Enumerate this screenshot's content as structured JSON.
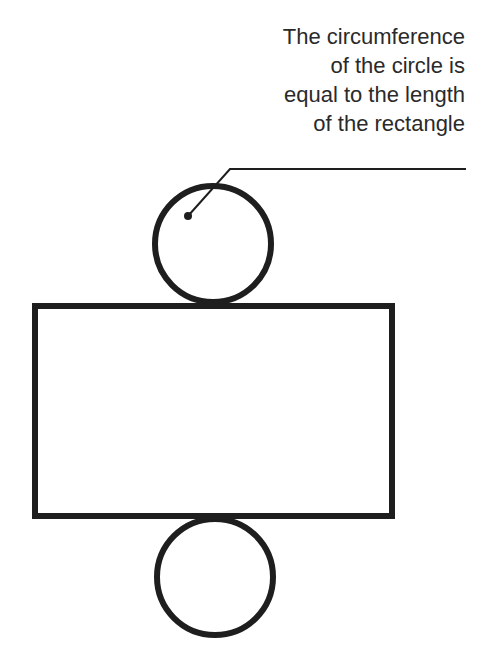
{
  "diagram": {
    "annotation_lines": [
      "The circumference",
      "of the circle is",
      "equal to the length",
      "of the rectangle"
    ],
    "stroke_color": "#1e1e1e",
    "shapes": {
      "top_circle": {
        "cx": 213,
        "cy": 244,
        "r": 58
      },
      "rectangle": {
        "x": 35,
        "y": 306,
        "width": 357,
        "height": 210
      },
      "bottom_circle": {
        "cx": 215,
        "cy": 577,
        "r": 58
      },
      "leader_line": {
        "dot": [
          188,
          216
        ],
        "bend": [
          230,
          169
        ],
        "end": [
          466,
          169
        ]
      }
    }
  }
}
